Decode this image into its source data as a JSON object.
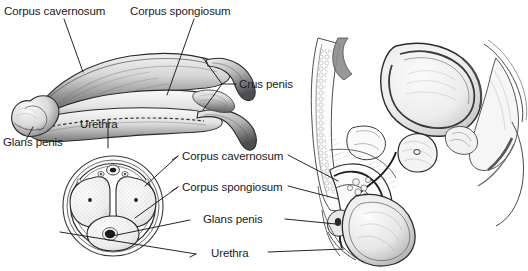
{
  "figure": {
    "background_color": "#ffffff",
    "ink_color": "#1a1a1a",
    "width": 528,
    "height": 271
  },
  "panels": [
    {
      "name": "three-quarter-view-penis",
      "description": "Three-quarter isolated view of the penis showing the corpora and crura"
    },
    {
      "name": "cross-section-penis",
      "description": "Transverse cross section of the penile shaft"
    },
    {
      "name": "sagittal-male-pelvis",
      "description": "Midsagittal section of the male pelvis with bladder, prostate, penis and scrotum"
    }
  ],
  "labels": {
    "top_left": "Corpus cavernosum",
    "top_right": "Corpus spongiosum",
    "crus": "Crus penis",
    "urethra_top": "Urethra",
    "glans_top": "Glans penis",
    "mid_cavernosum": "Corpus cavernosum",
    "mid_spongiosum": "Corpus spongiosum",
    "mid_glans": "Glans penis",
    "mid_urethra": "Urethra"
  }
}
